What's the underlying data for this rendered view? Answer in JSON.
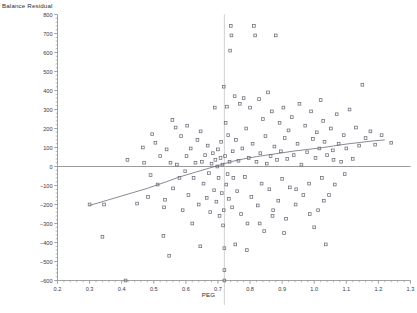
{
  "title": "Balance Residual",
  "xaxis_title": "PEG",
  "colors": {
    "axis": "#8a8a8a",
    "point": "#6b6b78",
    "trend": "#6b6b78",
    "reference": "#9a9a9a",
    "text": "#2b2b2b",
    "background": "#ffffff"
  },
  "chart_data": {
    "type": "scatter",
    "title": "Balance Residual",
    "xlabel": "PEG",
    "ylabel": "Balance Residual",
    "xlim": [
      0.2,
      1.3
    ],
    "ylim": [
      -600,
      800
    ],
    "grid": false,
    "legend": false,
    "xticks": [
      0.2,
      0.3,
      0.4,
      0.5,
      0.6,
      0.7,
      0.8,
      0.9,
      1.0,
      1.1,
      1.2,
      1.3
    ],
    "xtick_labels": [
      "0.2",
      "0.3",
      "0.4",
      "0.5",
      "0.6",
      "0.7",
      "0.8",
      "0.9",
      "1.0",
      "1.1",
      "1.2",
      "1.3"
    ],
    "yticks": [
      -600,
      -500,
      -400,
      -300,
      -200,
      -100,
      0,
      100,
      200,
      300,
      400,
      500,
      600,
      700,
      800
    ],
    "ytick_labels": [
      "−600",
      "−500",
      "−400",
      "−300",
      "−200",
      "−100",
      "0",
      "100",
      "200",
      "300",
      "400",
      "500",
      "600",
      "700",
      "800"
    ],
    "minor_ticks_per_interval": 5,
    "reference_lines": [
      {
        "name": "zero-horizontal",
        "orientation": "horizontal",
        "value": 0
      },
      {
        "name": "peg-vertical",
        "orientation": "vertical",
        "value": 0.72
      }
    ],
    "series": [
      {
        "name": "balance-residual-points",
        "marker": "open-square",
        "points": [
          [
            0.3,
            -200
          ],
          [
            0.34,
            -370
          ],
          [
            0.412,
            -600
          ],
          [
            0.418,
            35
          ],
          [
            0.47,
            20
          ],
          [
            0.482,
            -160
          ],
          [
            0.495,
            170
          ],
          [
            0.505,
            125
          ],
          [
            0.512,
            -95
          ],
          [
            0.52,
            55
          ],
          [
            0.53,
            -365
          ],
          [
            0.535,
            -175
          ],
          [
            0.54,
            90
          ],
          [
            0.548,
            -470
          ],
          [
            0.552,
            20
          ],
          [
            0.56,
            -115
          ],
          [
            0.568,
            205
          ],
          [
            0.572,
            10
          ],
          [
            0.58,
            -60
          ],
          [
            0.585,
            160
          ],
          [
            0.59,
            -230
          ],
          [
            0.598,
            -25
          ],
          [
            0.602,
            55
          ],
          [
            0.608,
            -150
          ],
          [
            0.615,
            95
          ],
          [
            0.62,
            -300
          ],
          [
            0.624,
            -60
          ],
          [
            0.63,
            20
          ],
          [
            0.636,
            140
          ],
          [
            0.64,
            -200
          ],
          [
            0.645,
            -420
          ],
          [
            0.65,
            25
          ],
          [
            0.655,
            -90
          ],
          [
            0.66,
            60
          ],
          [
            0.665,
            -165
          ],
          [
            0.668,
            110
          ],
          [
            0.672,
            -35
          ],
          [
            0.676,
            -240
          ],
          [
            0.68,
            15
          ],
          [
            0.684,
            70
          ],
          [
            0.688,
            -125
          ],
          [
            0.692,
            35
          ],
          [
            0.695,
            -185
          ],
          [
            0.698,
            0
          ],
          [
            0.7,
            90
          ],
          [
            0.702,
            -60
          ],
          [
            0.705,
            -260
          ],
          [
            0.708,
            45
          ],
          [
            0.71,
            130
          ],
          [
            0.712,
            -140
          ],
          [
            0.714,
            10
          ],
          [
            0.716,
            -310
          ],
          [
            0.718,
            -230
          ],
          [
            0.72,
            -430
          ],
          [
            0.72,
            -545
          ],
          [
            0.72,
            -600
          ],
          [
            0.722,
            55
          ],
          [
            0.724,
            230
          ],
          [
            0.726,
            -95
          ],
          [
            0.728,
            315
          ],
          [
            0.73,
            -40
          ],
          [
            0.732,
            165
          ],
          [
            0.734,
            -170
          ],
          [
            0.736,
            25
          ],
          [
            0.738,
            610
          ],
          [
            0.74,
            740
          ],
          [
            0.742,
            690
          ],
          [
            0.744,
            -215
          ],
          [
            0.746,
            80
          ],
          [
            0.748,
            -60
          ],
          [
            0.752,
            370
          ],
          [
            0.756,
            140
          ],
          [
            0.76,
            -130
          ],
          [
            0.764,
            30
          ],
          [
            0.768,
            330
          ],
          [
            0.772,
            -250
          ],
          [
            0.776,
            95
          ],
          [
            0.78,
            360
          ],
          [
            0.784,
            -55
          ],
          [
            0.788,
            200
          ],
          [
            0.792,
            -300
          ],
          [
            0.796,
            45
          ],
          [
            0.8,
            310
          ],
          [
            0.804,
            -160
          ],
          [
            0.808,
            120
          ],
          [
            0.812,
            740
          ],
          [
            0.816,
            690
          ],
          [
            0.82,
            25
          ],
          [
            0.824,
            -205
          ],
          [
            0.828,
            355
          ],
          [
            0.832,
            70
          ],
          [
            0.836,
            -90
          ],
          [
            0.84,
            250
          ],
          [
            0.844,
            -340
          ],
          [
            0.848,
            160
          ],
          [
            0.852,
            15
          ],
          [
            0.856,
            390
          ],
          [
            0.86,
            -120
          ],
          [
            0.864,
            55
          ],
          [
            0.868,
            290
          ],
          [
            0.872,
            -230
          ],
          [
            0.876,
            105
          ],
          [
            0.88,
            690
          ],
          [
            0.884,
            35
          ],
          [
            0.888,
            -180
          ],
          [
            0.892,
            230
          ],
          [
            0.896,
            80
          ],
          [
            0.9,
            -65
          ],
          [
            0.904,
            310
          ],
          [
            0.908,
            150
          ],
          [
            0.912,
            -275
          ],
          [
            0.916,
            40
          ],
          [
            0.92,
            190
          ],
          [
            0.924,
            -110
          ],
          [
            0.93,
            260
          ],
          [
            0.936,
            60
          ],
          [
            0.942,
            -200
          ],
          [
            0.948,
            120
          ],
          [
            0.954,
            330
          ],
          [
            0.96,
            10
          ],
          [
            0.966,
            -150
          ],
          [
            0.972,
            215
          ],
          [
            0.978,
            75
          ],
          [
            0.984,
            -90
          ],
          [
            0.99,
            290
          ],
          [
            0.996,
            145
          ],
          [
            1.0,
            -320
          ],
          [
            1.004,
            45
          ],
          [
            1.008,
            180
          ],
          [
            1.012,
            -230
          ],
          [
            1.016,
            95
          ],
          [
            1.02,
            350
          ],
          [
            1.024,
            -60
          ],
          [
            1.028,
            240
          ],
          [
            1.032,
            130
          ],
          [
            1.036,
            -410
          ],
          [
            1.04,
            60
          ],
          [
            1.046,
            -150
          ],
          [
            1.052,
            200
          ],
          [
            1.058,
            85
          ],
          [
            1.064,
            -95
          ],
          [
            1.07,
            275
          ],
          [
            1.076,
            120
          ],
          [
            1.084,
            25
          ],
          [
            1.092,
            165
          ],
          [
            1.1,
            95
          ],
          [
            1.11,
            300
          ],
          [
            1.12,
            40
          ],
          [
            1.13,
            205
          ],
          [
            1.14,
            110
          ],
          [
            1.15,
            430
          ],
          [
            1.16,
            150
          ],
          [
            1.175,
            185
          ],
          [
            1.19,
            115
          ],
          [
            1.21,
            165
          ],
          [
            1.24,
            125
          ],
          [
            0.448,
            -195
          ],
          [
            0.466,
            100
          ],
          [
            0.49,
            -45
          ],
          [
            0.558,
            245
          ],
          [
            0.604,
            215
          ],
          [
            0.646,
            185
          ],
          [
            0.69,
            310
          ],
          [
            0.718,
            420
          ],
          [
            0.754,
            -410
          ],
          [
            0.79,
            -440
          ],
          [
            0.83,
            -300
          ],
          [
            0.87,
            -260
          ],
          [
            0.906,
            -350
          ],
          [
            0.944,
            -120
          ],
          [
            0.986,
            -250
          ],
          [
            1.03,
            -180
          ],
          [
            1.06,
            35
          ],
          [
            1.095,
            -40
          ],
          [
            0.345,
            -200
          ],
          [
            0.532,
            -215
          ]
        ]
      }
    ],
    "trend_line": {
      "name": "lowess-smoother",
      "points": [
        [
          0.3,
          -205
        ],
        [
          0.36,
          -175
        ],
        [
          0.42,
          -145
        ],
        [
          0.48,
          -115
        ],
        [
          0.54,
          -80
        ],
        [
          0.58,
          -55
        ],
        [
          0.62,
          -35
        ],
        [
          0.66,
          -15
        ],
        [
          0.7,
          5
        ],
        [
          0.74,
          25
        ],
        [
          0.78,
          40
        ],
        [
          0.82,
          52
        ],
        [
          0.86,
          62
        ],
        [
          0.9,
          72
        ],
        [
          0.94,
          82
        ],
        [
          0.98,
          90
        ],
        [
          1.02,
          98
        ],
        [
          1.06,
          108
        ],
        [
          1.1,
          118
        ],
        [
          1.14,
          126
        ],
        [
          1.18,
          134
        ],
        [
          1.22,
          140
        ]
      ]
    }
  }
}
